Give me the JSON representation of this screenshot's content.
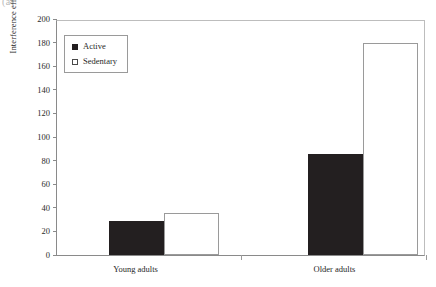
{
  "figure": {
    "corner_label": "(a)"
  },
  "chart_data": {
    "type": "bar",
    "title": "",
    "xlabel": "",
    "ylabel": "Interference effects (in ms)",
    "categories": [
      "Young adults",
      "Older adults"
    ],
    "series": [
      {
        "name": "Active",
        "values": [
          29,
          86
        ],
        "color": "#231f20",
        "style": "filled"
      },
      {
        "name": "Sedentary",
        "values": [
          36,
          180
        ],
        "color": "#ffffff",
        "style": "hollow"
      }
    ],
    "ylim": [
      0,
      200
    ],
    "yticks": [
      0,
      20,
      40,
      60,
      80,
      100,
      120,
      140,
      160,
      180,
      200
    ],
    "grid": false,
    "legend_position": "upper left"
  },
  "legend": {
    "entries": [
      {
        "label": "Active",
        "swatch": "filled-square-icon"
      },
      {
        "label": "Sedentary",
        "swatch": "hollow-square-icon"
      }
    ]
  }
}
